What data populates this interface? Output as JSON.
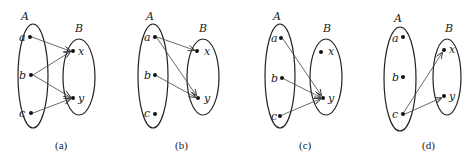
{
  "diagrams": [
    {
      "caption": "(a)",
      "setA_label": "A",
      "setB_label": "B",
      "elements_A": [
        "a",
        "b",
        "c"
      ],
      "elements_B": [
        "x",
        "y"
      ],
      "mappings": [
        [
          "a",
          "x"
        ],
        [
          "b",
          "x"
        ],
        [
          "b",
          "y"
        ],
        [
          "c",
          "y"
        ]
      ]
    },
    {
      "caption": "(b)",
      "setA_label": "A",
      "setB_label": "B",
      "elements_A": [
        "a",
        "b",
        "c"
      ],
      "elements_B": [
        "x",
        "y"
      ],
      "mappings": [
        [
          "a",
          "x"
        ],
        [
          "a",
          "y"
        ],
        [
          "b",
          "y"
        ]
      ]
    },
    {
      "caption": "(c)",
      "setA_label": "A",
      "setB_label": "B",
      "elements_A": [
        "a",
        "b",
        "c"
      ],
      "elements_B": [
        "x",
        "y"
      ],
      "mappings": [
        [
          "a",
          "y"
        ],
        [
          "b",
          "y"
        ],
        [
          "c",
          "y"
        ]
      ]
    },
    {
      "caption": "(d)",
      "setA_label": "A",
      "setB_label": "B",
      "elements_A": [
        "a",
        "b",
        "c"
      ],
      "elements_B": [
        "x",
        "y"
      ],
      "mappings": [
        [
          "c",
          "x"
        ],
        [
          "c",
          "y"
        ]
      ]
    }
  ]
}
